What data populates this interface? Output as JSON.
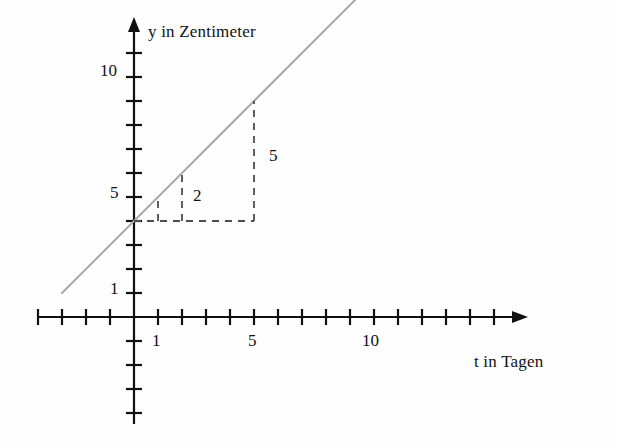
{
  "figure": {
    "background_color": "#fefefe",
    "axis_color": "#111111",
    "line_color": "#a9a9a9",
    "dash_color": "#4d4d4d"
  },
  "axes": {
    "y_title": "y in Zentimeter",
    "x_title": "t in Tagen",
    "origin_px": {
      "x": 134,
      "y": 317
    },
    "unit_px": 24,
    "x_tick_values": [
      -4,
      -3,
      -2,
      -1,
      1,
      2,
      3,
      4,
      5,
      6,
      7,
      8,
      9,
      10,
      11,
      12,
      13,
      14,
      15,
      16
    ],
    "y_tick_values": [
      -4,
      -3,
      -2,
      -1,
      1,
      2,
      3,
      4,
      5,
      6,
      7,
      8,
      9,
      10,
      11
    ],
    "x_tick_labels": [
      {
        "value": 1,
        "text": "1"
      },
      {
        "value": 5,
        "text": "5"
      },
      {
        "value": 10,
        "text": "10"
      }
    ],
    "y_tick_labels": [
      {
        "value": 1,
        "text": "1"
      },
      {
        "value": 5,
        "text": "5"
      },
      {
        "value": 10,
        "text": "10"
      }
    ]
  },
  "chart_data": {
    "type": "line",
    "title": "",
    "xlabel": "t in Tagen",
    "ylabel": "y in Zentimeter",
    "xlim": [
      -4,
      16
    ],
    "ylim": [
      -4,
      11
    ],
    "grid": false,
    "legend": "none",
    "series": [
      {
        "name": "Wachstumsgerade",
        "color": "#a9a9a9",
        "intercept": 4,
        "slope": 1,
        "x": [
          -3,
          10.9
        ],
        "y": [
          1,
          14.9
        ],
        "points": [
          {
            "t": 0,
            "y": 4
          },
          {
            "t": 1,
            "y": 5
          },
          {
            "t": 2,
            "y": 6
          },
          {
            "t": 5,
            "y": 9
          }
        ]
      }
    ],
    "annotations": [
      {
        "name": "baseline",
        "kind": "dashed-horizontal",
        "y": 4,
        "x_from": 0,
        "x_to": 5
      },
      {
        "name": "riser-at-1",
        "kind": "dashed-vertical",
        "x": 1,
        "y_from": 4,
        "y_to": 5
      },
      {
        "name": "riser-at-2",
        "kind": "dashed-vertical",
        "x": 2,
        "y_from": 4,
        "y_to": 6,
        "label": "2"
      },
      {
        "name": "riser-at-5",
        "kind": "dashed-vertical",
        "x": 5,
        "y_from": 4,
        "y_to": 9,
        "label": "5"
      }
    ]
  },
  "measure_labels": {
    "small_rise": "2",
    "large_rise": "5"
  }
}
